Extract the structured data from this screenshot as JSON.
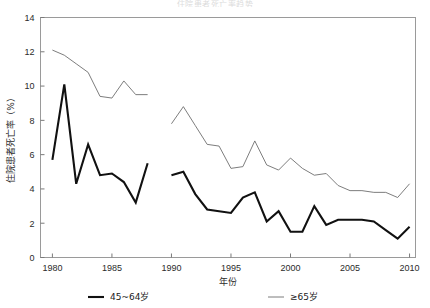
{
  "chart_data": {
    "type": "line",
    "title": "住院患者死亡率趋势",
    "xlabel": "年份",
    "ylabel": "住院患者死亡率（%）",
    "xlim": [
      1979,
      2010.5
    ],
    "ylim": [
      0,
      14
    ],
    "xticks": [
      1980,
      1985,
      1990,
      1995,
      2000,
      2005,
      2010
    ],
    "yticks": [
      0,
      2,
      4,
      6,
      8,
      10,
      12,
      14
    ],
    "grid": false,
    "legend_position": "bottom",
    "series": [
      {
        "name": "45~64岁",
        "color": "#111111",
        "width": 2.1,
        "segments": [
          {
            "x": [
              1980,
              1981,
              1982,
              1983,
              1984,
              1985,
              1986,
              1987,
              1988
            ],
            "y": [
              5.7,
              10.1,
              4.3,
              6.6,
              4.8,
              4.9,
              4.4,
              3.2,
              5.5
            ]
          },
          {
            "x": [
              1990,
              1991,
              1992,
              1993,
              1994,
              1995,
              1996,
              1997,
              1998,
              1999,
              2000,
              2001,
              2002,
              2003,
              2004,
              2005,
              2006,
              2007,
              2008,
              2009,
              2010
            ],
            "y": [
              4.8,
              5.0,
              3.7,
              2.8,
              2.7,
              2.6,
              3.5,
              3.8,
              2.1,
              2.7,
              1.5,
              1.5,
              3.0,
              1.9,
              2.2,
              2.2,
              2.2,
              2.1,
              1.6,
              1.1,
              1.8
            ]
          }
        ]
      },
      {
        "name": "≥65岁",
        "color": "#6e6e6e",
        "width": 0.9,
        "segments": [
          {
            "x": [
              1980,
              1981,
              1982,
              1983,
              1984,
              1985,
              1986,
              1987,
              1988
            ],
            "y": [
              12.1,
              11.8,
              11.3,
              10.8,
              9.4,
              9.3,
              10.3,
              9.5,
              9.5
            ]
          },
          {
            "x": [
              1990,
              1991,
              1992,
              1993,
              1994,
              1995,
              1996,
              1997,
              1998,
              1999,
              2000,
              2001,
              2002,
              2003,
              2004,
              2005,
              2006,
              2007,
              2008,
              2009,
              2010
            ],
            "y": [
              7.8,
              8.8,
              7.7,
              6.6,
              6.5,
              5.2,
              5.3,
              6.8,
              5.4,
              5.1,
              5.8,
              5.2,
              4.8,
              4.9,
              4.2,
              3.9,
              3.9,
              3.8,
              3.8,
              3.5,
              4.3
            ]
          }
        ]
      }
    ]
  }
}
